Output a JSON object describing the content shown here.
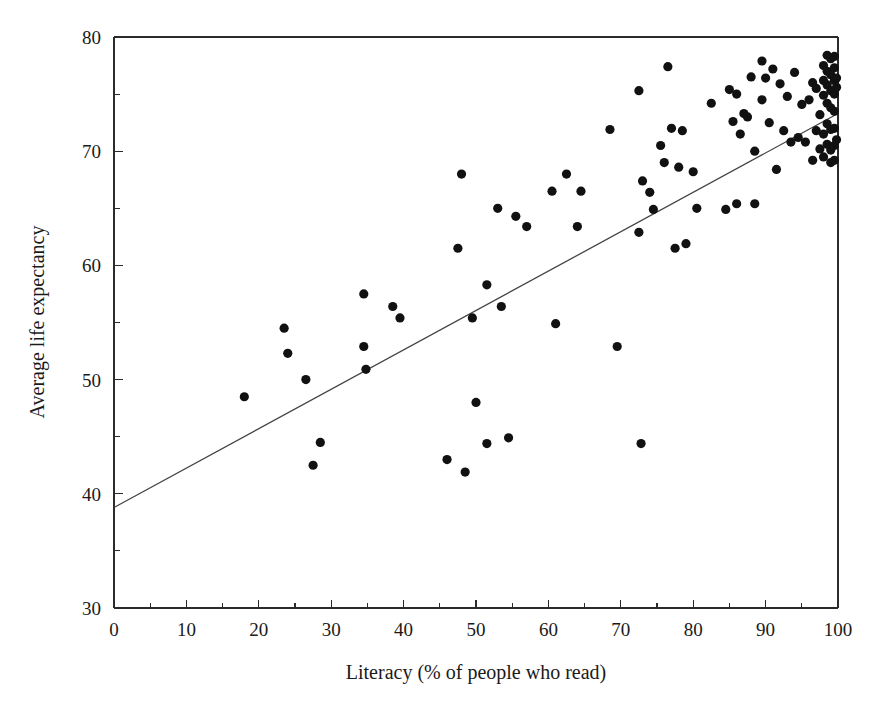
{
  "chart_data": {
    "type": "scatter",
    "title": "",
    "xlabel": "Literacy (% of people who read)",
    "ylabel": "Average life expectancy",
    "xlim": [
      0,
      100
    ],
    "ylim": [
      30,
      80
    ],
    "grid": false,
    "legend": "none",
    "x_major_ticks": [
      0,
      10,
      20,
      30,
      40,
      50,
      60,
      70,
      80,
      90,
      100
    ],
    "x_minor_ticks": [
      5,
      15,
      25,
      35,
      45,
      55,
      65,
      75,
      85,
      95
    ],
    "y_major_ticks": [
      30,
      40,
      50,
      60,
      70,
      80
    ],
    "y_minor_ticks": [
      35,
      45,
      55,
      65,
      75
    ],
    "x_tick_labels": [
      "0",
      "10",
      "20",
      "30",
      "40",
      "50",
      "60",
      "70",
      "80",
      "90",
      "100"
    ],
    "y_tick_labels": [
      "30",
      "40",
      "50",
      "60",
      "70",
      "80"
    ],
    "marker": "filled-circle",
    "marker_color": "#111111",
    "point_count": 109,
    "points": [
      [
        18.0,
        48.5
      ],
      [
        23.5,
        54.5
      ],
      [
        24.0,
        52.3
      ],
      [
        26.5,
        50.0
      ],
      [
        27.5,
        42.5
      ],
      [
        28.5,
        44.5
      ],
      [
        34.5,
        57.5
      ],
      [
        34.5,
        52.9
      ],
      [
        34.8,
        50.9
      ],
      [
        38.5,
        56.4
      ],
      [
        39.5,
        55.4
      ],
      [
        46.0,
        43.0
      ],
      [
        47.5,
        61.5
      ],
      [
        48.0,
        68.0
      ],
      [
        48.5,
        41.9
      ],
      [
        49.5,
        55.4
      ],
      [
        50.0,
        48.0
      ],
      [
        51.5,
        58.3
      ],
      [
        51.5,
        44.4
      ],
      [
        53.5,
        56.4
      ],
      [
        53.0,
        65.0
      ],
      [
        54.5,
        44.9
      ],
      [
        55.5,
        64.3
      ],
      [
        57.0,
        63.4
      ],
      [
        60.5,
        66.5
      ],
      [
        61.0,
        54.9
      ],
      [
        62.5,
        68.0
      ],
      [
        64.5,
        66.5
      ],
      [
        64.0,
        63.4
      ],
      [
        68.5,
        71.9
      ],
      [
        69.5,
        52.9
      ],
      [
        72.5,
        62.9
      ],
      [
        72.5,
        75.3
      ],
      [
        72.8,
        44.4
      ],
      [
        73.0,
        67.4
      ],
      [
        74.0,
        66.4
      ],
      [
        74.5,
        64.9
      ],
      [
        75.5,
        70.5
      ],
      [
        76.0,
        69.0
      ],
      [
        76.5,
        77.4
      ],
      [
        77.0,
        72.0
      ],
      [
        77.5,
        61.5
      ],
      [
        78.0,
        68.6
      ],
      [
        78.5,
        71.8
      ],
      [
        79.0,
        61.9
      ],
      [
        80.0,
        68.2
      ],
      [
        80.5,
        65.0
      ],
      [
        82.5,
        74.2
      ],
      [
        84.5,
        64.9
      ],
      [
        85.0,
        75.4
      ],
      [
        85.5,
        72.6
      ],
      [
        86.0,
        75.0
      ],
      [
        86.5,
        71.5
      ],
      [
        86.0,
        65.4
      ],
      [
        87.0,
        73.3
      ],
      [
        87.5,
        73.0
      ],
      [
        88.0,
        76.5
      ],
      [
        88.5,
        70.0
      ],
      [
        88.5,
        65.4
      ],
      [
        89.5,
        77.9
      ],
      [
        89.5,
        74.5
      ],
      [
        90.0,
        76.4
      ],
      [
        90.5,
        72.5
      ],
      [
        91.0,
        77.2
      ],
      [
        91.5,
        68.4
      ],
      [
        92.0,
        75.9
      ],
      [
        92.5,
        71.8
      ],
      [
        93.0,
        74.8
      ],
      [
        93.5,
        70.8
      ],
      [
        94.0,
        76.9
      ],
      [
        94.5,
        71.2
      ],
      [
        95.0,
        74.1
      ],
      [
        95.5,
        70.8
      ],
      [
        96.0,
        74.5
      ],
      [
        96.5,
        69.2
      ],
      [
        96.5,
        76.0
      ],
      [
        97.0,
        71.8
      ],
      [
        97.0,
        75.5
      ],
      [
        97.5,
        73.2
      ],
      [
        97.5,
        70.2
      ],
      [
        98.0,
        77.5
      ],
      [
        98.0,
        76.2
      ],
      [
        98.0,
        74.9
      ],
      [
        98.0,
        71.5
      ],
      [
        98.0,
        69.5
      ],
      [
        98.5,
        78.4
      ],
      [
        98.5,
        77.0
      ],
      [
        98.5,
        75.8
      ],
      [
        98.5,
        74.2
      ],
      [
        98.5,
        72.4
      ],
      [
        98.5,
        70.6
      ],
      [
        99.0,
        78.1
      ],
      [
        99.0,
        76.7
      ],
      [
        99.0,
        75.3
      ],
      [
        99.0,
        73.8
      ],
      [
        99.0,
        71.9
      ],
      [
        99.0,
        70.1
      ],
      [
        99.0,
        69.0
      ],
      [
        99.5,
        78.3
      ],
      [
        99.5,
        77.3
      ],
      [
        99.5,
        76.2
      ],
      [
        99.5,
        75.0
      ],
      [
        99.5,
        73.5
      ],
      [
        99.5,
        72.0
      ],
      [
        99.5,
        70.5
      ],
      [
        99.5,
        69.2
      ],
      [
        99.8,
        76.4
      ],
      [
        99.8,
        75.6
      ],
      [
        99.8,
        71.0
      ]
    ],
    "fit_line": {
      "type": "linear-regression",
      "x_start": 0,
      "y_start": 38.8,
      "x_end": 100,
      "y_end": 73.3,
      "slope": 0.345,
      "intercept": 38.8,
      "color": "#444444"
    }
  }
}
